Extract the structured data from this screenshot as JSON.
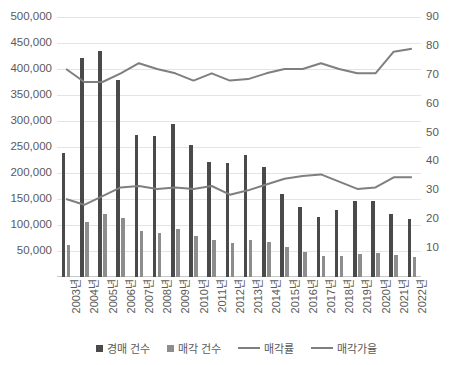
{
  "chart_data": {
    "type": "bar",
    "title": "",
    "subtitle": "",
    "xlabel": "",
    "ylabel_left": "",
    "ylabel_right": "",
    "grid": true,
    "legend_position": "bottom",
    "categories": [
      "2003년",
      "2004년",
      "2005년",
      "2006년",
      "2007년",
      "2008년",
      "2009년",
      "2010년",
      "2011년",
      "2012년",
      "2013년",
      "2014년",
      "2015년",
      "2016년",
      "2017년",
      "2018년",
      "2019년",
      "2020년",
      "2021년",
      "2022년"
    ],
    "axes": {
      "left": {
        "ticks": [
          "50,000",
          "100,000",
          "150,000",
          "200,000",
          "250,000",
          "300,000",
          "350,000",
          "400,000",
          "450,000",
          "500,000"
        ],
        "tick_values": [
          50000,
          100000,
          150000,
          200000,
          250000,
          300000,
          350000,
          400000,
          450000,
          500000
        ],
        "ylim": [
          0,
          500000
        ]
      },
      "right": {
        "ticks": [
          "10",
          "20",
          "30",
          "40",
          "50",
          "60",
          "70",
          "80",
          "90"
        ],
        "tick_values": [
          10,
          20,
          30,
          40,
          50,
          60,
          70,
          80,
          90
        ],
        "ylim": [
          0,
          90
        ]
      }
    },
    "series": [
      {
        "name": "경매 건수",
        "kind": "bar",
        "axis": "left",
        "color": "#4a4a4a",
        "values": [
          238000,
          421000,
          435000,
          378000,
          273000,
          272000,
          295000,
          253000,
          222000,
          220000,
          234000,
          211000,
          160000,
          134000,
          116000,
          128000,
          147000,
          147000,
          122000,
          112000
        ]
      },
      {
        "name": "매각 건수",
        "kind": "bar",
        "axis": "left",
        "color": "#8d8d8d",
        "values": [
          61000,
          105000,
          122000,
          114000,
          89000,
          84000,
          93000,
          79000,
          72000,
          66000,
          71000,
          68000,
          58000,
          48000,
          40000,
          40000,
          44000,
          46000,
          43000,
          38000
        ]
      },
      {
        "name": "매각률",
        "kind": "line",
        "axis": "right",
        "color": "#7f7f7f",
        "values": [
          27.0,
          25.0,
          28.0,
          31.0,
          31.5,
          30.5,
          31.0,
          30.5,
          31.5,
          28.5,
          30.0,
          32.0,
          34.0,
          35.0,
          35.5,
          33.0,
          30.5,
          31.0,
          34.5,
          34.5
        ]
      },
      {
        "name": "매각가율",
        "kind": "line",
        "axis": "right",
        "color": "#7f7f7f",
        "values": [
          72.0,
          67.5,
          67.5,
          70.5,
          74.0,
          72.0,
          70.5,
          68.0,
          70.5,
          68.0,
          68.5,
          70.5,
          72.0,
          72.0,
          74.0,
          72.0,
          70.5,
          70.5,
          78.0,
          79.0
        ]
      }
    ]
  },
  "legend": {
    "items": [
      {
        "label": "경매 건수",
        "marker": "square-dark"
      },
      {
        "label": "매각 건수",
        "marker": "square-light"
      },
      {
        "label": "매각률",
        "marker": "line"
      },
      {
        "label": "매각가율",
        "marker": "line"
      }
    ]
  }
}
